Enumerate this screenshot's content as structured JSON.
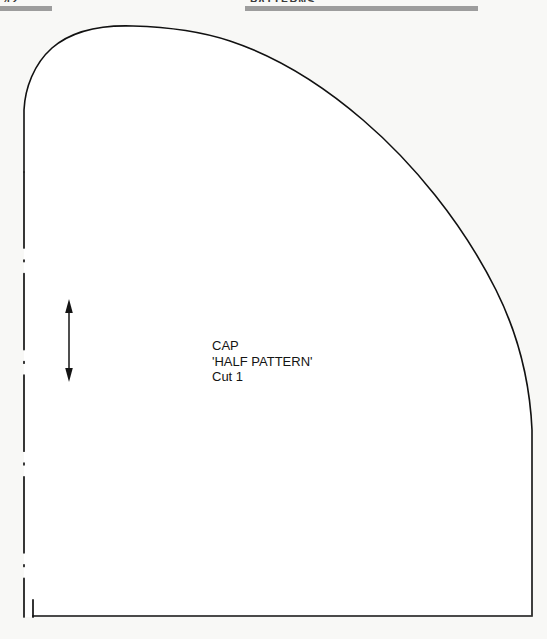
{
  "page": {
    "background_color": "#f8f8f6",
    "width": 547,
    "height": 639
  },
  "header": {
    "bar_color": "#9d9d9d",
    "page_number": "42",
    "section_title": "PATTERNS",
    "left_bar_label": "header-rule-left",
    "right_bar_label": "header-rule-right"
  },
  "pattern": {
    "name": "cap-half-pattern",
    "line_color": "#111111",
    "fill_color": "#ffffff",
    "outline_width": 1.6,
    "fold_line": {
      "name": "fold-line",
      "style": "dash-dot",
      "x": 24,
      "y_top": 172,
      "y_bottom": 617
    },
    "grain_line": {
      "name": "grain-line-arrow",
      "x": 69,
      "y_top": 300,
      "y_bottom": 381,
      "heads": 2
    },
    "labels": {
      "title": "CAP",
      "subtitle": "'HALF PATTERN'",
      "cut": "Cut 1"
    }
  }
}
